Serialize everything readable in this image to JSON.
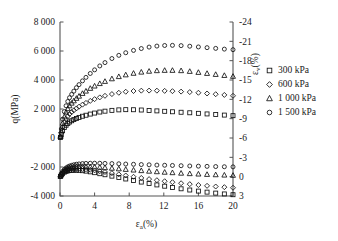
{
  "chart_data": {
    "type": "scatter",
    "title": "",
    "xlabel": "εa(%)",
    "xlabel_base": "ε",
    "xlabel_sub": "a",
    "xlabel_unit": "(%)",
    "ylabel_left": "q(MPa)",
    "ylabel_right": "εv(%)",
    "ylabel_right_base": "ε",
    "ylabel_right_sub": "v",
    "ylabel_right_unit": "(%)",
    "xlim": [
      0,
      20
    ],
    "xticks": [
      0,
      4,
      8,
      12,
      16,
      20
    ],
    "xtick_labels": [
      "0",
      "4",
      "8",
      "12",
      "16",
      "20"
    ],
    "ylim_left": [
      -4000,
      8000
    ],
    "yticks_left": [
      -4000,
      -2000,
      0,
      2000,
      4000,
      6000,
      8000
    ],
    "ytick_labels_left": [
      "-4 000",
      "-2 000",
      "0",
      "2 000",
      "4 000",
      "6 000",
      "8 000"
    ],
    "ylim_right": [
      3,
      -24
    ],
    "yticks_right": [
      3,
      0,
      -3,
      -6,
      -9,
      -12,
      -15,
      -18,
      -21,
      -24
    ],
    "ytick_labels_right": [
      "3",
      "0",
      "-3",
      "-6",
      "-9",
      "-12",
      "-15",
      "-18",
      "-21",
      "-24"
    ],
    "grid": false,
    "legend_position": "right-outside",
    "marker_colors": "#111111",
    "series": [
      {
        "name": "300 kPa",
        "marker": "square",
        "axis": "left",
        "quantity": "q",
        "x": [
          0.05,
          0.15,
          0.3,
          0.5,
          0.7,
          0.9,
          1.1,
          1.35,
          1.6,
          1.9,
          2.2,
          2.6,
          3.0,
          3.5,
          4.0,
          4.6,
          5.2,
          6.0,
          6.8,
          7.6,
          8.5,
          9.4,
          10.3,
          11.2,
          12.1,
          13.0,
          14.0,
          15.0,
          16.0,
          17.0,
          18.0,
          19.0,
          20.0
        ],
        "y": [
          40,
          230,
          500,
          720,
          880,
          1000,
          1100,
          1190,
          1270,
          1350,
          1420,
          1500,
          1570,
          1650,
          1720,
          1790,
          1850,
          1905,
          1940,
          1955,
          1950,
          1930,
          1900,
          1870,
          1840,
          1810,
          1775,
          1740,
          1700,
          1660,
          1620,
          1580,
          1540
        ]
      },
      {
        "name": "600 kPa",
        "marker": "diamond",
        "axis": "left",
        "quantity": "q",
        "x": [
          0.05,
          0.15,
          0.3,
          0.5,
          0.7,
          0.9,
          1.1,
          1.35,
          1.6,
          1.9,
          2.2,
          2.6,
          3.0,
          3.5,
          4.0,
          4.6,
          5.2,
          6.0,
          6.8,
          7.6,
          8.5,
          9.4,
          10.3,
          11.2,
          12.1,
          13.0,
          14.0,
          15.0,
          16.0,
          17.0,
          18.0,
          19.0,
          20.0
        ],
        "y": [
          60,
          350,
          760,
          1080,
          1320,
          1500,
          1650,
          1790,
          1910,
          2040,
          2160,
          2300,
          2420,
          2560,
          2680,
          2800,
          2910,
          3030,
          3120,
          3190,
          3240,
          3265,
          3270,
          3265,
          3250,
          3230,
          3200,
          3165,
          3120,
          3070,
          3020,
          2970,
          2910
        ]
      },
      {
        "name": "1 000 kPa",
        "marker": "triangle",
        "axis": "left",
        "quantity": "q",
        "x": [
          0.05,
          0.15,
          0.3,
          0.5,
          0.7,
          0.9,
          1.1,
          1.35,
          1.6,
          1.9,
          2.2,
          2.6,
          3.0,
          3.5,
          4.0,
          4.6,
          5.2,
          6.0,
          6.8,
          7.6,
          8.5,
          9.4,
          10.3,
          11.2,
          12.1,
          13.0,
          14.0,
          15.0,
          16.0,
          17.0,
          18.0,
          19.0,
          20.0
        ],
        "y": [
          80,
          480,
          1020,
          1450,
          1780,
          2020,
          2220,
          2400,
          2560,
          2730,
          2880,
          3070,
          3230,
          3420,
          3580,
          3750,
          3900,
          4080,
          4230,
          4350,
          4460,
          4540,
          4600,
          4640,
          4660,
          4660,
          4640,
          4590,
          4520,
          4450,
          4380,
          4310,
          4250
        ]
      },
      {
        "name": "1 500 kPa",
        "marker": "circle",
        "axis": "left",
        "quantity": "q",
        "x": [
          0.05,
          0.15,
          0.3,
          0.5,
          0.7,
          0.9,
          1.1,
          1.35,
          1.6,
          1.9,
          2.2,
          2.6,
          3.0,
          3.5,
          4.0,
          4.6,
          5.2,
          6.0,
          6.8,
          7.6,
          8.5,
          9.4,
          10.3,
          11.2,
          12.1,
          13.0,
          14.0,
          15.0,
          16.0,
          17.0,
          18.0,
          19.0,
          20.0
        ],
        "y": [
          100,
          620,
          1300,
          1820,
          2220,
          2520,
          2780,
          3010,
          3230,
          3470,
          3680,
          3940,
          4180,
          4450,
          4700,
          4970,
          5200,
          5480,
          5700,
          5880,
          6040,
          6170,
          6270,
          6340,
          6380,
          6390,
          6370,
          6330,
          6280,
          6230,
          6180,
          6130,
          6090
        ]
      },
      {
        "name": "300 kPa",
        "marker": "square",
        "axis": "right",
        "quantity": "ev",
        "x": [
          0.05,
          0.15,
          0.3,
          0.5,
          0.7,
          0.9,
          1.1,
          1.35,
          1.6,
          1.9,
          2.2,
          2.6,
          3.0,
          3.5,
          4.0,
          4.6,
          5.2,
          6.0,
          6.8,
          7.6,
          8.5,
          9.4,
          10.3,
          11.2,
          12.1,
          13.0,
          14.0,
          15.0,
          16.0,
          17.0,
          18.0,
          19.0,
          20.0
        ],
        "y": [
          -0.05,
          -0.25,
          -0.5,
          -0.7,
          -0.82,
          -0.9,
          -0.95,
          -0.98,
          -1.0,
          -1.0,
          -0.98,
          -0.93,
          -0.86,
          -0.75,
          -0.62,
          -0.46,
          -0.3,
          -0.08,
          0.14,
          0.36,
          0.6,
          0.84,
          1.06,
          1.28,
          1.48,
          1.68,
          1.88,
          2.07,
          2.24,
          2.4,
          2.55,
          2.68,
          2.8
        ]
      },
      {
        "name": "600 kPa",
        "marker": "diamond",
        "axis": "right",
        "quantity": "ev",
        "x": [
          0.05,
          0.15,
          0.3,
          0.5,
          0.7,
          0.9,
          1.1,
          1.35,
          1.6,
          1.9,
          2.2,
          2.6,
          3.0,
          3.5,
          4.0,
          4.6,
          5.2,
          6.0,
          6.8,
          7.6,
          8.5,
          9.4,
          10.3,
          11.2,
          12.1,
          13.0,
          14.0,
          15.0,
          16.0,
          17.0,
          18.0,
          19.0,
          20.0
        ],
        "y": [
          -0.06,
          -0.3,
          -0.6,
          -0.83,
          -0.98,
          -1.08,
          -1.15,
          -1.2,
          -1.23,
          -1.24,
          -1.23,
          -1.2,
          -1.15,
          -1.07,
          -0.97,
          -0.85,
          -0.72,
          -0.54,
          -0.36,
          -0.18,
          0.02,
          0.2,
          0.38,
          0.55,
          0.71,
          0.86,
          1.02,
          1.16,
          1.3,
          1.42,
          1.53,
          1.63,
          1.72
        ]
      },
      {
        "name": "1 000 kPa",
        "marker": "triangle",
        "axis": "right",
        "quantity": "ev",
        "x": [
          0.05,
          0.15,
          0.3,
          0.5,
          0.7,
          0.9,
          1.1,
          1.35,
          1.6,
          1.9,
          2.2,
          2.6,
          3.0,
          3.5,
          4.0,
          4.6,
          5.2,
          6.0,
          6.8,
          7.6,
          8.5,
          9.4,
          10.3,
          11.2,
          12.1,
          13.0,
          14.0,
          15.0,
          16.0,
          17.0,
          18.0,
          19.0,
          20.0
        ],
        "y": [
          -0.07,
          -0.35,
          -0.7,
          -0.97,
          -1.15,
          -1.28,
          -1.37,
          -1.45,
          -1.5,
          -1.54,
          -1.56,
          -1.57,
          -1.56,
          -1.54,
          -1.5,
          -1.45,
          -1.39,
          -1.3,
          -1.21,
          -1.12,
          -1.02,
          -0.93,
          -0.84,
          -0.76,
          -0.68,
          -0.61,
          -0.53,
          -0.46,
          -0.4,
          -0.34,
          -0.29,
          -0.24,
          -0.2
        ]
      },
      {
        "name": "1 500 kPa",
        "marker": "circle",
        "axis": "right",
        "quantity": "ev",
        "x": [
          0.05,
          0.15,
          0.3,
          0.5,
          0.7,
          0.9,
          1.1,
          1.35,
          1.6,
          1.9,
          2.2,
          2.6,
          3.0,
          3.5,
          4.0,
          4.6,
          5.2,
          6.0,
          6.8,
          7.6,
          8.5,
          9.4,
          10.3,
          11.2,
          12.1,
          13.0,
          14.0,
          15.0,
          16.0,
          17.0,
          18.0,
          19.0,
          20.0
        ],
        "y": [
          -0.08,
          -0.4,
          -0.8,
          -1.12,
          -1.35,
          -1.52,
          -1.65,
          -1.76,
          -1.85,
          -1.93,
          -1.98,
          -2.03,
          -2.06,
          -2.08,
          -2.09,
          -2.08,
          -2.06,
          -2.03,
          -2.0,
          -1.96,
          -1.92,
          -1.88,
          -1.84,
          -1.8,
          -1.77,
          -1.74,
          -1.7,
          -1.66,
          -1.63,
          -1.6,
          -1.57,
          -1.54,
          -1.52
        ]
      }
    ],
    "legend": [
      {
        "label": "300 kPa",
        "marker": "square"
      },
      {
        "label": "600 kPa",
        "marker": "diamond"
      },
      {
        "label": "1 000 kPa",
        "marker": "triangle"
      },
      {
        "label": "1 500 kPa",
        "marker": "circle"
      }
    ]
  }
}
